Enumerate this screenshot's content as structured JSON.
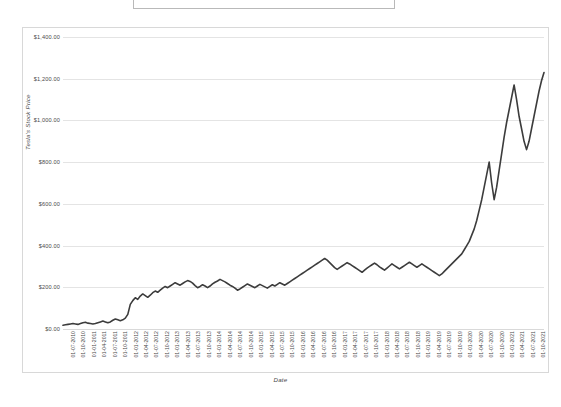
{
  "title": {
    "text": "",
    "placeholder": "Chart Title"
  },
  "axes": {
    "y_title": "Tesla's Stock Price",
    "x_title": "Date"
  },
  "colors": {
    "line": "#3c3c3c",
    "gridline": "#e4e4e4",
    "frame": "#d8d8d8",
    "text": "#4a4a4a",
    "background": "#ffffff"
  },
  "chart_data": {
    "type": "line",
    "title": "",
    "xlabel": "Date",
    "ylabel": "Tesla's Stock Price",
    "ylim": [
      0,
      1400
    ],
    "ytick_labels": [
      "$0.00",
      "$200.00",
      "$400.00",
      "$600.00",
      "$800.00",
      "$1,000.00",
      "$1,200.00",
      "$1,400.00"
    ],
    "ytick_values": [
      0,
      200,
      400,
      600,
      800,
      1000,
      1200,
      1400
    ],
    "grid": true,
    "legend": "none",
    "series_name": "Tesla's Stock Price",
    "categories": [
      "01-07-2010",
      "01-10-2010",
      "01-01-2011",
      "01-04-2011",
      "01-07-2011",
      "01-10-2011",
      "01-01-2012",
      "01-04-2012",
      "01-07-2012",
      "01-10-2012",
      "01-01-2013",
      "01-04-2013",
      "01-07-2013",
      "01-10-2013",
      "01-01-2014",
      "01-04-2014",
      "01-07-2014",
      "01-10-2014",
      "01-01-2015",
      "01-04-2015",
      "01-07-2015",
      "01-10-2015",
      "01-01-2016",
      "01-04-2016",
      "01-07-2016",
      "01-10-2016",
      "01-01-2017",
      "01-04-2017",
      "01-07-2017",
      "01-10-2017",
      "01-01-2018",
      "01-04-2018",
      "01-07-2018",
      "01-10-2018",
      "01-01-2019",
      "01-04-2019",
      "01-07-2019",
      "01-10-2019",
      "01-01-2020",
      "01-04-2020",
      "01-07-2020",
      "01-10-2020",
      "01-01-2021",
      "01-04-2021",
      "01-07-2021",
      "01-10-2021"
    ],
    "values": [
      20,
      21,
      24,
      26,
      28,
      25,
      29,
      36,
      28,
      29,
      35,
      43,
      124,
      162,
      181,
      208,
      223,
      241,
      203,
      202,
      266,
      227,
      191,
      230,
      213,
      202,
      229,
      303,
      327,
      341,
      354,
      257,
      300,
      310,
      310,
      267,
      233,
      300,
      430,
      500,
      1050,
      1300,
      2200,
      2400,
      2350,
      3500
    ],
    "values_note": "Plotted price series in USD after rendering scale; chart y-axis spans $0.00 to $1,400.00",
    "plotted_points": [
      {
        "x": "01-07-2010",
        "y": 20
      },
      {
        "x": "01-10-2010",
        "y": 21
      },
      {
        "x": "01-01-2011",
        "y": 24
      },
      {
        "x": "01-04-2011",
        "y": 26
      },
      {
        "x": "01-07-2011",
        "y": 28
      },
      {
        "x": "01-10-2011",
        "y": 25
      },
      {
        "x": "01-01-2012",
        "y": 29
      },
      {
        "x": "01-04-2012",
        "y": 36
      },
      {
        "x": "01-07-2012",
        "y": 28
      },
      {
        "x": "01-10-2012",
        "y": 29
      },
      {
        "x": "01-01-2013",
        "y": 35
      },
      {
        "x": "01-04-2013",
        "y": 43
      },
      {
        "x": "01-07-2013",
        "y": 124
      },
      {
        "x": "01-10-2013",
        "y": 162
      },
      {
        "x": "01-01-2014",
        "y": 181
      },
      {
        "x": "01-04-2014",
        "y": 208
      },
      {
        "x": "01-07-2014",
        "y": 223
      },
      {
        "x": "01-10-2014",
        "y": 241
      },
      {
        "x": "01-01-2015",
        "y": 203
      },
      {
        "x": "01-04-2015",
        "y": 202
      },
      {
        "x": "01-07-2015",
        "y": 266
      },
      {
        "x": "01-10-2015",
        "y": 227
      },
      {
        "x": "01-01-2016",
        "y": 191
      },
      {
        "x": "01-04-2016",
        "y": 230
      },
      {
        "x": "01-07-2016",
        "y": 213
      },
      {
        "x": "01-10-2016",
        "y": 202
      },
      {
        "x": "01-01-2017",
        "y": 229
      },
      {
        "x": "01-04-2017",
        "y": 303
      },
      {
        "x": "01-07-2017",
        "y": 327
      },
      {
        "x": "01-10-2017",
        "y": 341
      },
      {
        "x": "01-01-2018",
        "y": 354
      },
      {
        "x": "01-04-2018",
        "y": 257
      },
      {
        "x": "01-07-2018",
        "y": 300
      },
      {
        "x": "01-10-2018",
        "y": 310
      },
      {
        "x": "01-01-2019",
        "y": 310
      },
      {
        "x": "01-04-2019",
        "y": 267
      },
      {
        "x": "01-07-2019",
        "y": 233
      },
      {
        "x": "01-10-2019",
        "y": 300
      },
      {
        "x": "01-01-2020",
        "y": 430
      },
      {
        "x": "01-04-2020",
        "y": 500
      },
      {
        "x": "01-07-2020",
        "y": 1050
      },
      {
        "x": "01-10-2020",
        "y": 1300
      },
      {
        "x": "01-01-2021",
        "y": 2200
      },
      {
        "x": "01-04-2021",
        "y": 2400
      },
      {
        "x": "01-07-2021",
        "y": 2350
      },
      {
        "x": "01-10-2021",
        "y": 3500
      }
    ],
    "rendered_path_values": [
      18,
      20,
      22,
      24,
      26,
      24,
      22,
      26,
      30,
      32,
      28,
      26,
      24,
      26,
      30,
      34,
      38,
      34,
      30,
      34,
      42,
      48,
      44,
      40,
      44,
      52,
      70,
      118,
      136,
      150,
      142,
      158,
      168,
      160,
      152,
      162,
      174,
      182,
      176,
      186,
      196,
      204,
      198,
      206,
      214,
      222,
      216,
      210,
      218,
      226,
      232,
      228,
      220,
      208,
      198,
      204,
      212,
      206,
      198,
      206,
      216,
      224,
      230,
      238,
      232,
      226,
      218,
      210,
      204,
      196,
      186,
      192,
      200,
      208,
      216,
      210,
      204,
      198,
      206,
      214,
      208,
      202,
      196,
      204,
      212,
      206,
      214,
      222,
      216,
      210,
      218,
      226,
      234,
      242,
      250,
      258,
      266,
      274,
      282,
      290,
      298,
      306,
      314,
      322,
      330,
      338,
      330,
      318,
      306,
      294,
      286,
      294,
      302,
      310,
      318,
      312,
      304,
      296,
      288,
      280,
      272,
      282,
      292,
      300,
      308,
      316,
      308,
      298,
      290,
      282,
      292,
      302,
      312,
      304,
      296,
      288,
      296,
      304,
      312,
      320,
      312,
      304,
      296,
      304,
      312,
      304,
      296,
      288,
      280,
      272,
      264,
      256,
      264,
      276,
      288,
      300,
      312,
      324,
      336,
      348,
      360,
      380,
      400,
      420,
      450,
      480,
      520,
      570,
      620,
      680,
      740,
      800,
      700,
      620,
      680,
      760,
      840,
      920,
      990,
      1050,
      1110,
      1170,
      1100,
      1020,
      960,
      900,
      860,
      900,
      960,
      1020,
      1080,
      1140,
      1190,
      1230
    ]
  }
}
